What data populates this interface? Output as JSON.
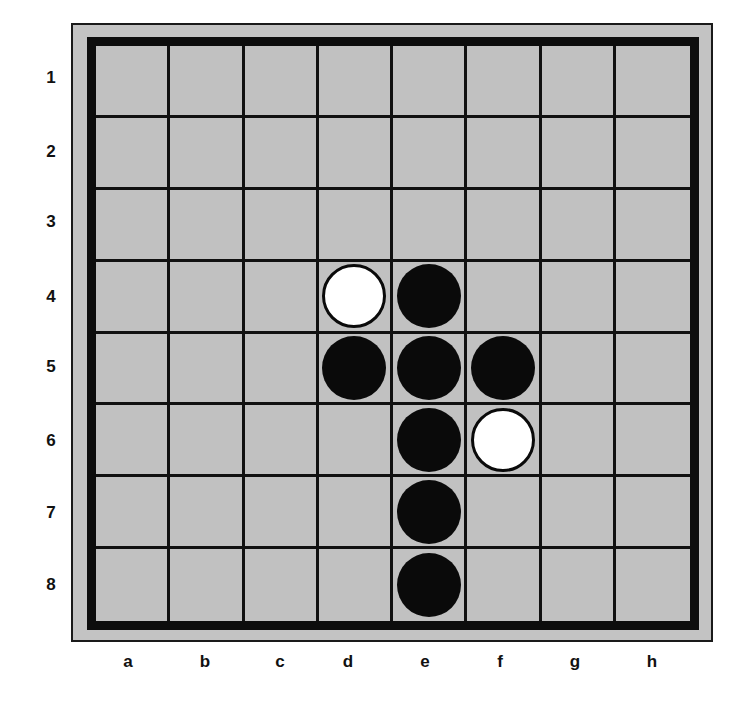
{
  "game": "Othello / Reversi",
  "columns": [
    "a",
    "b",
    "c",
    "d",
    "e",
    "f",
    "g",
    "h"
  ],
  "rows": [
    "1",
    "2",
    "3",
    "4",
    "5",
    "6",
    "7",
    "8"
  ],
  "colors": {
    "board": "#c1c1c1",
    "frame": "#c3c3c3",
    "grid": "#111111",
    "black_disc": "#0a0a0a",
    "white_disc": "#ffffff"
  },
  "board": [
    [
      "",
      "",
      "",
      "",
      "",
      "",
      "",
      ""
    ],
    [
      "",
      "",
      "",
      "",
      "",
      "",
      "",
      ""
    ],
    [
      "",
      "",
      "",
      "",
      "",
      "",
      "",
      ""
    ],
    [
      "",
      "",
      "",
      "W",
      "B",
      "",
      "",
      ""
    ],
    [
      "",
      "",
      "",
      "B",
      "B",
      "B",
      "",
      ""
    ],
    [
      "",
      "",
      "",
      "",
      "B",
      "W",
      "",
      ""
    ],
    [
      "",
      "",
      "",
      "",
      "B",
      "",
      "",
      ""
    ],
    [
      "",
      "",
      "",
      "",
      "B",
      "",
      "",
      ""
    ]
  ],
  "pieces": [
    {
      "square": "d4",
      "color": "white"
    },
    {
      "square": "e4",
      "color": "black"
    },
    {
      "square": "d5",
      "color": "black"
    },
    {
      "square": "e5",
      "color": "black"
    },
    {
      "square": "f5",
      "color": "black"
    },
    {
      "square": "e6",
      "color": "black"
    },
    {
      "square": "f6",
      "color": "white"
    },
    {
      "square": "e7",
      "color": "black"
    },
    {
      "square": "e8",
      "color": "black"
    }
  ]
}
